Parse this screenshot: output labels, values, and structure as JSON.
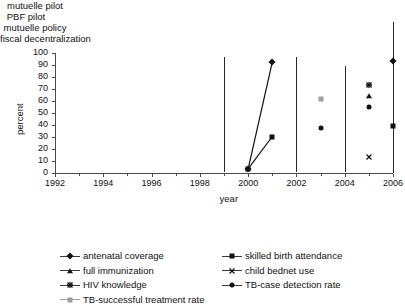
{
  "chart_data": {
    "type": "scatter",
    "title": "",
    "xlabel": "year",
    "ylabel": "percent",
    "xlim": [
      1992,
      2006
    ],
    "ylim": [
      0,
      100
    ],
    "xticks": [
      1992,
      1994,
      1996,
      1998,
      2000,
      2002,
      2004,
      2006
    ],
    "xtick_labels": [
      "1992",
      "1994",
      "1996",
      "1998",
      "2000",
      "2002",
      "2004",
      "2006"
    ],
    "xminor_ticks": [
      1993,
      1995,
      1997,
      1999,
      2001,
      2003,
      2005
    ],
    "yticks": [
      0,
      10,
      20,
      30,
      40,
      50,
      60,
      70,
      80,
      90,
      100
    ],
    "ytick_labels": [
      "0",
      "10",
      "20",
      "30",
      "40",
      "50",
      "60",
      "70",
      "80",
      "90",
      "100"
    ],
    "grid": false,
    "legend_position": "below",
    "series": [
      {
        "name": "antenatal coverage",
        "marker": "diamond",
        "color": "#111111",
        "connected": true,
        "points": [
          {
            "x": 2000,
            "y": 3
          },
          {
            "x": 2001,
            "y": 92
          },
          {
            "x": 2006,
            "y": 93
          }
        ]
      },
      {
        "name": "skilled birth attendance",
        "marker": "square",
        "color": "#111111",
        "connected": true,
        "points": [
          {
            "x": 2000,
            "y": 3
          },
          {
            "x": 2001,
            "y": 30
          },
          {
            "x": 2006,
            "y": 39
          }
        ]
      },
      {
        "name": "full immunization",
        "marker": "triangle",
        "color": "#111111",
        "connected": false,
        "points": [
          {
            "x": 2005,
            "y": 64
          }
        ]
      },
      {
        "name": "child bednet use",
        "marker": "x",
        "color": "#111111",
        "connected": false,
        "points": [
          {
            "x": 2005,
            "y": 13
          }
        ]
      },
      {
        "name": "HIV knowledge",
        "marker": "star",
        "color": "#111111",
        "connected": false,
        "points": [
          {
            "x": 2005,
            "y": 73
          }
        ]
      },
      {
        "name": "TB-case detection rate",
        "marker": "circle",
        "color": "#111111",
        "connected": false,
        "points": [
          {
            "x": 2003,
            "y": 37
          },
          {
            "x": 2005,
            "y": 55
          }
        ]
      },
      {
        "name": "TB-successful treatment rate",
        "marker": "gray-square",
        "color": "#9d9d9d",
        "connected": false,
        "points": [
          {
            "x": 2003,
            "y": 61
          }
        ]
      }
    ],
    "annotations": [
      {
        "label": "mutuelle pilot",
        "x": 1999,
        "line_top_percent": 96
      },
      {
        "label": "PBF pilot",
        "x": 2002,
        "line_top_percent": 96
      },
      {
        "label": "mutuelle policy",
        "x": 2004,
        "line_top_percent": 89
      },
      {
        "label": "fiscal decentralization",
        "x": 2006,
        "line_top_percent": 112
      }
    ]
  },
  "legend": {
    "items": [
      {
        "label": "antenatal coverage",
        "marker": "diamond"
      },
      {
        "label": "skilled birth attendance",
        "marker": "square"
      },
      {
        "label": "full immunization",
        "marker": "triangle"
      },
      {
        "label": "child bednet use",
        "marker": "x"
      },
      {
        "label": "HIV knowledge",
        "marker": "star"
      },
      {
        "label": "TB-case detection rate",
        "marker": "circle"
      },
      {
        "label": "TB-successful treatment rate",
        "marker": "gray-square"
      }
    ]
  }
}
